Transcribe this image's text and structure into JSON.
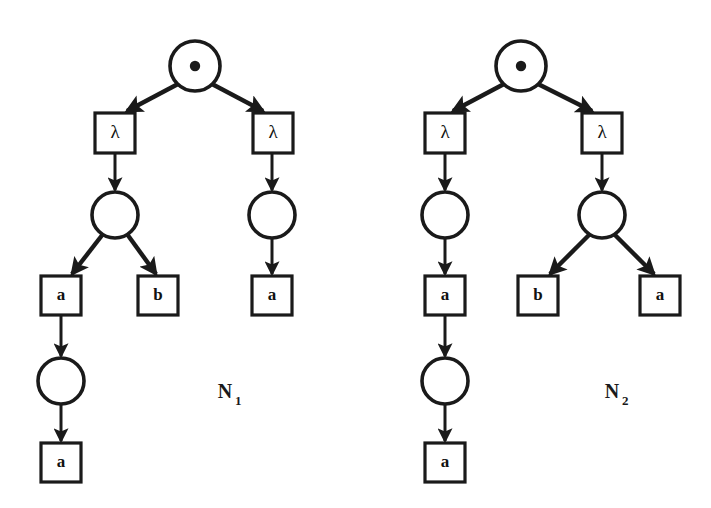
{
  "figure": {
    "kind": "petri-net-process-trees",
    "background_color": "#ffffff",
    "ink_color": "#1a1a1a",
    "width": 711,
    "height": 508
  },
  "trees": [
    {
      "id": "N1",
      "name": "N",
      "name_subscript": "1",
      "label_x": 225,
      "label_y": 398,
      "nodes": [
        {
          "id": "n1-root",
          "type": "circle-with-dot",
          "label": "•",
          "cx": 195,
          "cy": 66,
          "r": 25
        },
        {
          "id": "n1-lam-l",
          "type": "box",
          "label": "λ",
          "x": 95,
          "y": 113,
          "w": 40,
          "h": 40
        },
        {
          "id": "n1-lam-r",
          "type": "box",
          "label": "λ",
          "x": 253,
          "y": 113,
          "w": 40,
          "h": 40
        },
        {
          "id": "n1-circ-l",
          "type": "circle",
          "label": "",
          "cx": 115,
          "cy": 215,
          "r": 23
        },
        {
          "id": "n1-circ-r",
          "type": "circle",
          "label": "",
          "cx": 272,
          "cy": 215,
          "r": 23
        },
        {
          "id": "n1-a1",
          "type": "box",
          "label": "a",
          "x": 41,
          "y": 276,
          "w": 40,
          "h": 39
        },
        {
          "id": "n1-b1",
          "type": "box",
          "label": "b",
          "x": 138,
          "y": 276,
          "w": 40,
          "h": 39
        },
        {
          "id": "n1-a2",
          "type": "box",
          "label": "a",
          "x": 252,
          "y": 276,
          "w": 40,
          "h": 39
        },
        {
          "id": "n1-circ-b",
          "type": "circle",
          "label": "",
          "cx": 61,
          "cy": 381,
          "r": 23
        },
        {
          "id": "n1-a3",
          "type": "box",
          "label": "a",
          "x": 41,
          "y": 443,
          "w": 40,
          "h": 39
        }
      ],
      "edges": [
        {
          "from": "n1-root",
          "to": "n1-lam-l",
          "x1": 178,
          "y1": 84,
          "x2": 127,
          "y2": 111,
          "thick": true
        },
        {
          "from": "n1-root",
          "to": "n1-lam-r",
          "x1": 212,
          "y1": 84,
          "x2": 263,
          "y2": 111,
          "thick": true
        },
        {
          "from": "n1-lam-l",
          "to": "n1-circ-l",
          "x1": 115,
          "y1": 153,
          "x2": 115,
          "y2": 190,
          "thick": false
        },
        {
          "from": "n1-lam-r",
          "to": "n1-circ-r",
          "x1": 272,
          "y1": 153,
          "x2": 272,
          "y2": 190,
          "thick": false
        },
        {
          "from": "n1-circ-l",
          "to": "n1-a1",
          "x1": 103,
          "y1": 234,
          "x2": 72,
          "y2": 274,
          "thick": true
        },
        {
          "from": "n1-circ-l",
          "to": "n1-b1",
          "x1": 127,
          "y1": 234,
          "x2": 156,
          "y2": 274,
          "thick": true
        },
        {
          "from": "n1-circ-r",
          "to": "n1-a2",
          "x1": 272,
          "y1": 238,
          "x2": 272,
          "y2": 274,
          "thick": false
        },
        {
          "from": "n1-a1",
          "to": "n1-circ-b",
          "x1": 61,
          "y1": 315,
          "x2": 61,
          "y2": 356,
          "thick": false
        },
        {
          "from": "n1-circ-b",
          "to": "n1-a3",
          "x1": 61,
          "y1": 404,
          "x2": 61,
          "y2": 441,
          "thick": false
        }
      ]
    },
    {
      "id": "N2",
      "name": "N",
      "name_subscript": "2",
      "label_x": 612,
      "label_y": 398,
      "nodes": [
        {
          "id": "n2-root",
          "type": "circle-with-dot",
          "label": "•",
          "cx": 521,
          "cy": 66,
          "r": 25
        },
        {
          "id": "n2-lam-l",
          "type": "box",
          "label": "λ",
          "x": 425,
          "y": 113,
          "w": 40,
          "h": 40
        },
        {
          "id": "n2-lam-r",
          "type": "box",
          "label": "λ",
          "x": 582,
          "y": 113,
          "w": 40,
          "h": 40
        },
        {
          "id": "n2-circ-l",
          "type": "circle",
          "label": "",
          "cx": 445,
          "cy": 215,
          "r": 23
        },
        {
          "id": "n2-circ-r",
          "type": "circle",
          "label": "",
          "cx": 602,
          "cy": 215,
          "r": 23
        },
        {
          "id": "n2-a1",
          "type": "box",
          "label": "a",
          "x": 425,
          "y": 276,
          "w": 40,
          "h": 39
        },
        {
          "id": "n2-b1",
          "type": "box",
          "label": "b",
          "x": 518,
          "y": 276,
          "w": 40,
          "h": 39
        },
        {
          "id": "n2-a2",
          "type": "box",
          "label": "a",
          "x": 640,
          "y": 276,
          "w": 40,
          "h": 39
        },
        {
          "id": "n2-circ-b",
          "type": "circle",
          "label": "",
          "cx": 445,
          "cy": 381,
          "r": 23
        },
        {
          "id": "n2-a3",
          "type": "box",
          "label": "a",
          "x": 425,
          "y": 443,
          "w": 40,
          "h": 39
        }
      ],
      "edges": [
        {
          "from": "n2-root",
          "to": "n2-lam-l",
          "x1": 504,
          "y1": 84,
          "x2": 453,
          "y2": 111,
          "thick": true
        },
        {
          "from": "n2-root",
          "to": "n2-lam-r",
          "x1": 538,
          "y1": 84,
          "x2": 592,
          "y2": 111,
          "thick": true
        },
        {
          "from": "n2-lam-l",
          "to": "n2-circ-l",
          "x1": 445,
          "y1": 153,
          "x2": 445,
          "y2": 190,
          "thick": false
        },
        {
          "from": "n2-lam-r",
          "to": "n2-circ-r",
          "x1": 602,
          "y1": 153,
          "x2": 602,
          "y2": 190,
          "thick": false
        },
        {
          "from": "n2-circ-l",
          "to": "n2-a1",
          "x1": 445,
          "y1": 238,
          "x2": 445,
          "y2": 274,
          "thick": false
        },
        {
          "from": "n2-circ-r",
          "to": "n2-b1",
          "x1": 590,
          "y1": 234,
          "x2": 550,
          "y2": 274,
          "thick": true
        },
        {
          "from": "n2-circ-r",
          "to": "n2-a2",
          "x1": 614,
          "y1": 234,
          "x2": 654,
          "y2": 274,
          "thick": true
        },
        {
          "from": "n2-a1",
          "to": "n2-circ-b",
          "x1": 445,
          "y1": 315,
          "x2": 445,
          "y2": 356,
          "thick": false
        },
        {
          "from": "n2-circ-b",
          "to": "n2-a3",
          "x1": 445,
          "y1": 404,
          "x2": 445,
          "y2": 441,
          "thick": false
        }
      ]
    }
  ]
}
